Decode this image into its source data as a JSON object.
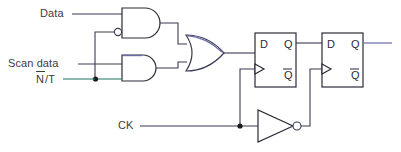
{
  "diagram": {
    "labels": {
      "data": "Data",
      "scan_data": "Scan data",
      "nt_n": "N",
      "nt_rest": "/T",
      "ck": "CK"
    },
    "pins": {
      "d": "D",
      "q": "Q",
      "qbar": "Q"
    },
    "gates": [
      {
        "name": "and-gate-data",
        "type": "and",
        "inverted_input": true
      },
      {
        "name": "and-gate-scan",
        "type": "and",
        "inverted_input": false
      },
      {
        "name": "or-gate",
        "type": "or",
        "inverted_input": false
      },
      {
        "name": "inverter-clock",
        "type": "not",
        "inverted_input": false
      }
    ],
    "flipflops": [
      {
        "name": "flip-flop-1",
        "label": "D"
      },
      {
        "name": "flip-flop-2",
        "label": "D"
      }
    ],
    "colors": {
      "wire": "#3a3a55",
      "wire_green": "#2f7f6f",
      "wire_purple": "#6b6ba8",
      "text": "#3c3c3c",
      "background": "#ffffff"
    }
  }
}
